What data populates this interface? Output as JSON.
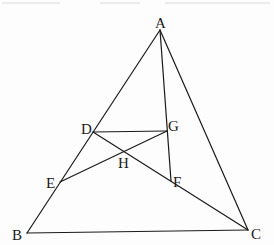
{
  "diagram": {
    "type": "geometry",
    "points": {
      "A": {
        "x": 160,
        "y": 30
      },
      "B": {
        "x": 27,
        "y": 233
      },
      "C": {
        "x": 248,
        "y": 230
      },
      "D": {
        "x": 93,
        "y": 132
      },
      "E": {
        "x": 60,
        "y": 182
      },
      "G": {
        "x": 167,
        "y": 131
      },
      "F": {
        "x": 171,
        "y": 181
      },
      "H": {
        "x": 124,
        "y": 152
      }
    },
    "labels": [
      {
        "id": "A",
        "text": "A",
        "x": 155,
        "y": 28
      },
      {
        "id": "B",
        "text": "B",
        "x": 12,
        "y": 240
      },
      {
        "id": "C",
        "text": "C",
        "x": 251,
        "y": 239
      },
      {
        "id": "D",
        "text": "D",
        "x": 81,
        "y": 134
      },
      {
        "id": "E",
        "text": "E",
        "x": 46,
        "y": 188
      },
      {
        "id": "G",
        "text": "G",
        "x": 168,
        "y": 131
      },
      {
        "id": "F",
        "text": "F",
        "x": 173,
        "y": 187
      },
      {
        "id": "H",
        "text": "H",
        "x": 118,
        "y": 168
      }
    ],
    "segments": [
      [
        "A",
        "B"
      ],
      [
        "B",
        "C"
      ],
      [
        "A",
        "C"
      ],
      [
        "A",
        "F"
      ],
      [
        "D",
        "G"
      ],
      [
        "D",
        "C"
      ],
      [
        "E",
        "G"
      ]
    ]
  }
}
